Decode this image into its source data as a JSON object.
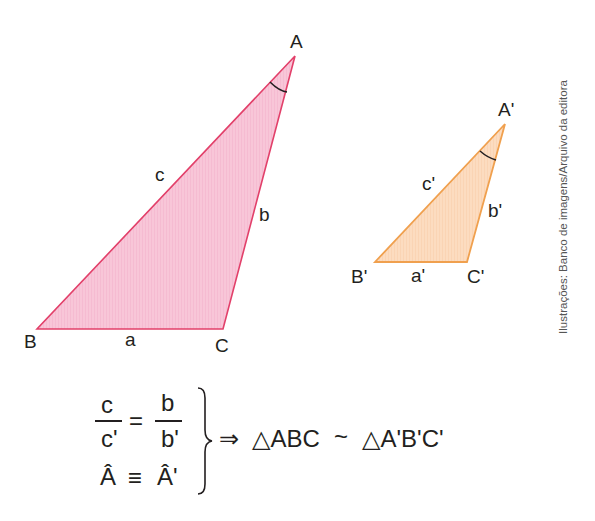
{
  "top_cut_text": {
    "left": "y",
    "right": "...ângulos, ABC e A'B'C'"
  },
  "figure": {
    "large_triangle": {
      "vertices": {
        "A": "A",
        "B": "B",
        "C": "C"
      },
      "sides": {
        "a": "a",
        "b": "b",
        "c": "c"
      },
      "fill": "#f8c6d8",
      "stroke": "#e2406a"
    },
    "small_triangle": {
      "vertices": {
        "A": "A'",
        "B": "B'",
        "C": "C'"
      },
      "sides": {
        "a": "a'",
        "b": "b'",
        "c": "c'"
      },
      "fill": "#fcdcc0",
      "stroke": "#f0a04e"
    },
    "credit": "Ilustrações: Banco de imagens/Arquivo da editora"
  },
  "formula": {
    "frac1_num": "c",
    "frac1_den": "c'",
    "equals": "=",
    "frac2_num": "b",
    "frac2_den": "b'",
    "angle_left": "Â",
    "congruent": "≡",
    "angle_right": "Â'",
    "implies": "⇒",
    "lhs_triangle": "△ABC",
    "similar": "~",
    "rhs_triangle": "△A'B'C'"
  }
}
